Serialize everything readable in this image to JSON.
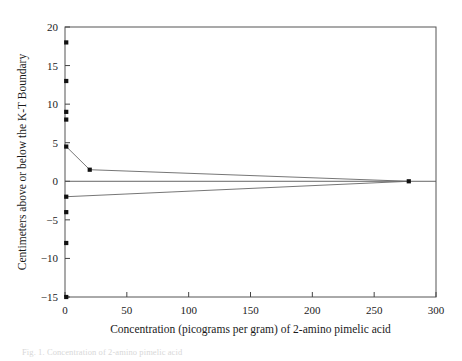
{
  "figure": {
    "caption": "Fig. 1. Concentration of 2-amino pimelic acid"
  },
  "chart_data": {
    "type": "scatter",
    "title": "",
    "xlabel": "Concentration (picograms per gram) of 2-amino pimelic acid",
    "ylabel": "Centimeters above or below the K-T Boundary",
    "xlim": [
      0,
      300
    ],
    "ylim": [
      -15,
      20
    ],
    "xticks": [
      0,
      50,
      100,
      150,
      200,
      250,
      300
    ],
    "xtick_labels": [
      "0",
      "50",
      "100",
      "150",
      "200",
      "250",
      "300"
    ],
    "yticks": [
      -15,
      -10,
      -5,
      0,
      5,
      10,
      15,
      20
    ],
    "ytick_labels": [
      "-15",
      "-10",
      "-5",
      "0",
      "5",
      "10",
      "15",
      "20"
    ],
    "grid": false,
    "legend": false,
    "zero_reference_line": 0,
    "series": [
      {
        "name": "2-amino pimelic acid concentration vs. depth",
        "x": [
          1,
          1,
          1,
          1,
          1,
          20,
          278,
          1,
          1,
          1,
          1
        ],
        "y": [
          18,
          13,
          9,
          8,
          4.5,
          1.5,
          0,
          -2,
          -4,
          -8,
          -15
        ]
      }
    ],
    "connected_paths": [
      {
        "name": "upper-envelope",
        "points": [
          [
            1,
            4.5
          ],
          [
            20,
            1.5
          ],
          [
            278,
            0
          ]
        ]
      },
      {
        "name": "lower-envelope",
        "points": [
          [
            1,
            -2
          ],
          [
            278,
            0
          ]
        ]
      }
    ],
    "points": [
      {
        "x": 1,
        "y": 18
      },
      {
        "x": 1,
        "y": 13
      },
      {
        "x": 1,
        "y": 9
      },
      {
        "x": 1,
        "y": 8
      },
      {
        "x": 1,
        "y": 4.5
      },
      {
        "x": 20,
        "y": 1.5
      },
      {
        "x": 278,
        "y": 0
      },
      {
        "x": 1,
        "y": -2
      },
      {
        "x": 1,
        "y": -4
      },
      {
        "x": 1,
        "y": -8
      },
      {
        "x": 1,
        "y": -15
      }
    ]
  }
}
